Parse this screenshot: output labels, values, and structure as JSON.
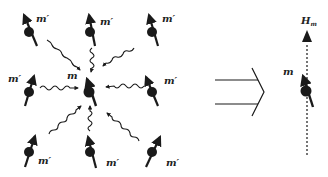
{
  "diagram": {
    "left_panel": {
      "central_spin": {
        "label": "m",
        "x": 89,
        "y": 92
      },
      "surrounding_spins": [
        {
          "label": "m′",
          "x": 29,
          "y": 32,
          "label_x": 36,
          "label_y": 20
        },
        {
          "label": "m′",
          "x": 90,
          "y": 32,
          "label_x": 100,
          "label_y": 23
        },
        {
          "label": "m′",
          "x": 152,
          "y": 32,
          "label_x": 162,
          "label_y": 20
        },
        {
          "label": "m′",
          "x": 29,
          "y": 92,
          "label_x": 8,
          "label_y": 80
        },
        {
          "label": "m′",
          "x": 152,
          "y": 92,
          "label_x": 164,
          "label_y": 82
        },
        {
          "label": "m′",
          "x": 29,
          "y": 152,
          "label_x": 38,
          "label_y": 164
        },
        {
          "label": "m′",
          "x": 90,
          "y": 152,
          "label_x": 106,
          "label_y": 166
        },
        {
          "label": "m′",
          "x": 152,
          "y": 152,
          "label_x": 166,
          "label_y": 166
        }
      ],
      "interaction": "wavy arrows from each m′ toward central m"
    },
    "implies_symbol": "⟹",
    "right_panel": {
      "spin": {
        "label": "m",
        "x": 305,
        "y": 92
      },
      "field": {
        "label": "H",
        "subscript": "m",
        "style": "dashed vertical arrow"
      }
    },
    "colors": {
      "ink": "#1a1a1a",
      "background": "#ffffff"
    }
  }
}
